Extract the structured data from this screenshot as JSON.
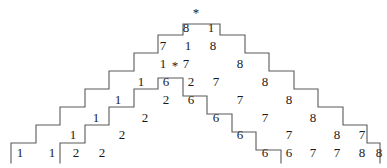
{
  "figure": {
    "background_color": "#ffffff",
    "line_color": "#5a5a5a",
    "text_color": "#1a1a1a",
    "stars": [
      {
        "name": "apex-star",
        "symbol": "*",
        "x": 196,
        "y": 13
      },
      {
        "name": "inner-star",
        "symbol": "*",
        "x": 175,
        "y": 68
      }
    ],
    "labels": [
      {
        "name": "digit-1",
        "text": "1",
        "x": 20,
        "y": 157
      },
      {
        "name": "digit-2",
        "text": "1",
        "x": 52,
        "y": 157
      },
      {
        "name": "digit-3",
        "text": "2",
        "x": 76,
        "y": 157
      },
      {
        "name": "digit-4",
        "text": "2",
        "x": 102,
        "y": 157
      },
      {
        "name": "digit-5",
        "text": "1",
        "x": 73,
        "y": 139
      },
      {
        "name": "digit-6",
        "text": "2",
        "x": 122,
        "y": 139
      },
      {
        "name": "digit-7",
        "text": "1",
        "x": 96,
        "y": 122
      },
      {
        "name": "digit-8",
        "text": "2",
        "x": 145,
        "y": 122
      },
      {
        "name": "digit-9",
        "text": "1",
        "x": 118,
        "y": 104
      },
      {
        "name": "digit-10",
        "text": "2",
        "x": 166,
        "y": 104
      },
      {
        "name": "digit-11",
        "text": "6",
        "x": 191,
        "y": 104
      },
      {
        "name": "digit-12",
        "text": "1",
        "x": 141,
        "y": 86
      },
      {
        "name": "digit-13",
        "text": "6",
        "x": 166,
        "y": 86
      },
      {
        "name": "digit-14",
        "text": "2",
        "x": 191,
        "y": 86
      },
      {
        "name": "digit-15",
        "text": "7",
        "x": 216,
        "y": 86
      },
      {
        "name": "digit-16",
        "text": "8",
        "x": 265,
        "y": 86
      },
      {
        "name": "digit-17",
        "text": "1",
        "x": 163,
        "y": 68
      },
      {
        "name": "digit-18",
        "text": "7",
        "x": 186,
        "y": 68
      },
      {
        "name": "digit-19",
        "text": "8",
        "x": 240,
        "y": 68
      },
      {
        "name": "digit-20",
        "text": "7",
        "x": 163,
        "y": 50
      },
      {
        "name": "digit-21",
        "text": "1",
        "x": 188,
        "y": 50
      },
      {
        "name": "digit-22",
        "text": "8",
        "x": 213,
        "y": 50
      },
      {
        "name": "digit-23",
        "text": "8",
        "x": 186,
        "y": 32
      },
      {
        "name": "digit-24",
        "text": "1",
        "x": 211,
        "y": 32
      },
      {
        "name": "digit-25",
        "text": "7",
        "x": 240,
        "y": 104
      },
      {
        "name": "digit-26",
        "text": "8",
        "x": 289,
        "y": 104
      },
      {
        "name": "digit-27",
        "text": "6",
        "x": 216,
        "y": 122
      },
      {
        "name": "digit-28",
        "text": "7",
        "x": 265,
        "y": 122
      },
      {
        "name": "digit-29",
        "text": "8",
        "x": 313,
        "y": 122
      },
      {
        "name": "digit-30",
        "text": "6",
        "x": 240,
        "y": 139
      },
      {
        "name": "digit-31",
        "text": "7",
        "x": 289,
        "y": 139
      },
      {
        "name": "digit-32",
        "text": "8",
        "x": 337,
        "y": 139
      },
      {
        "name": "digit-33",
        "text": "7",
        "x": 362,
        "y": 139
      },
      {
        "name": "digit-34",
        "text": "6",
        "x": 265,
        "y": 157
      },
      {
        "name": "digit-35",
        "text": "6",
        "x": 289,
        "y": 157
      },
      {
        "name": "digit-36",
        "text": "7",
        "x": 313,
        "y": 157
      },
      {
        "name": "digit-37",
        "text": "7",
        "x": 337,
        "y": 157
      },
      {
        "name": "digit-38",
        "text": "8",
        "x": 362,
        "y": 157
      },
      {
        "name": "digit-39",
        "text": "8",
        "x": 379,
        "y": 157
      }
    ],
    "outlines": [
      {
        "name": "left-outer-staircase",
        "d": "M 11,163 L 11,143 L 36,143 L 36,125 L 60,125 L 60,107 L 85,107 L 85,89 L 109,89 L 109,71 L 134,71 L 134,53 L 158,53 L 158,35 L 183,35 L 183,24 L 220,24 L 220,35 L 245,35 L 245,53 L 269,53 L 269,71 L 294,71 L 294,89 L 318,89 L 318,107 L 343,107 L 343,125 L 367,125 L 367,143 L 380,143 L 380,163"
      },
      {
        "name": "left-inner-staircase",
        "d": "M 60,163 L 60,143 L 85,143 L 85,125 L 109,125 L 109,107 L 134,107 L 134,89 L 158,89 L 158,78 L 183,78 L 183,96 L 207,96 L 207,114 L 232,114 L 232,132 L 256,132 L 256,150 L 281,150 L 281,163"
      }
    ]
  }
}
